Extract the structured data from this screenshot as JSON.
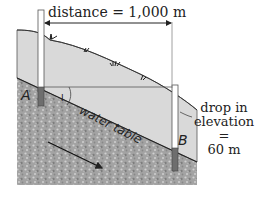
{
  "diagram": {
    "distance_label": "distance = 1,000 m",
    "water_table_label": "water table",
    "wells": [
      {
        "id": "A",
        "label": "A"
      },
      {
        "id": "B",
        "label": "B"
      }
    ],
    "angle_label": "I",
    "drop_label": {
      "line1": "drop in",
      "line2": "elevation =",
      "line3": "60 m"
    },
    "colors": {
      "soil": "#d9d9d9",
      "aquifer": "#9a9a9a",
      "well_screen": "#6e6e6e",
      "line": "#222222"
    },
    "icons": [
      "double-arrow-icon",
      "flow-arrow-icon",
      "grass-tuft-icon"
    ]
  }
}
